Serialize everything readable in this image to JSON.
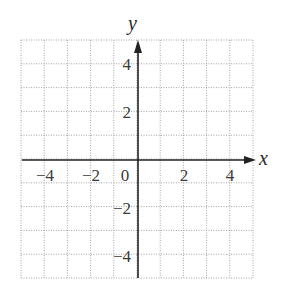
{
  "chart_data": {
    "type": "scatter",
    "title": "",
    "xlabel": "x",
    "ylabel": "y",
    "xlim": [
      -5,
      5
    ],
    "ylim": [
      -5,
      5
    ],
    "grid": true,
    "grid_style": "dotted",
    "grid_step": 1,
    "x_ticks": [
      -4,
      -2,
      0,
      2,
      4
    ],
    "y_ticks": [
      -4,
      -2,
      2,
      4
    ],
    "series": []
  },
  "labels": {
    "x_axis": "x",
    "y_axis": "y",
    "x_tick_labels": [
      "−4",
      "−2",
      "0",
      "2",
      "4"
    ],
    "y_tick_labels": [
      "4",
      "2",
      "−2",
      "−4"
    ]
  },
  "colors": {
    "grid": "#9a9a9a",
    "axis": "#222222",
    "text": "#3a3a3a"
  }
}
